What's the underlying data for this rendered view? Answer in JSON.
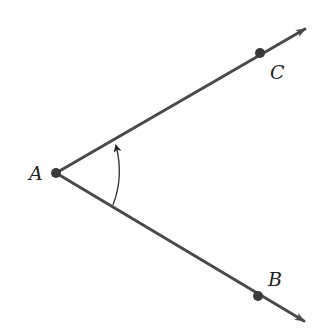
{
  "diagram": {
    "colors": {
      "ray": "#4a4a4a",
      "point": "#3a3a3a",
      "arc": "#3a3a3a",
      "label": "#222222",
      "background": "#ffffff"
    },
    "vertex": {
      "label": "A",
      "x": 56,
      "y": 173
    },
    "points": [
      {
        "label": "C",
        "x": 260,
        "y": 53
      },
      {
        "label": "B",
        "x": 258,
        "y": 296
      }
    ],
    "rays": [
      {
        "name": "ray-AC",
        "from": "A",
        "through": "C",
        "end_x": 306,
        "end_y": 28
      },
      {
        "name": "ray-AB",
        "from": "A",
        "through": "B",
        "end_x": 305,
        "end_y": 322
      }
    ],
    "angle_arc": {
      "from_ray": "AB",
      "to_ray": "AC",
      "direction": "counterclockwise",
      "arrow_at": "AC"
    },
    "labels": {
      "A": "A",
      "B": "B",
      "C": "C"
    }
  }
}
